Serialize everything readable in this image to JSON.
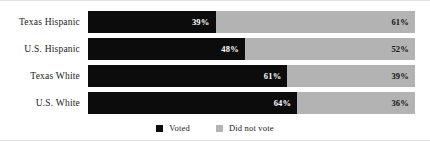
{
  "chart_data": {
    "type": "bar",
    "title": "",
    "subtitle": "",
    "xlabel": "",
    "ylabel": "",
    "orientation": "horizontal",
    "stacked": true,
    "normalized_percent": true,
    "grid": false,
    "xlim": [
      0,
      100
    ],
    "legend_position": "bottom-center",
    "categories": [
      "Texas Hispanic",
      "U.S. Hispanic",
      "Texas White",
      "U.S. White"
    ],
    "series": [
      {
        "name": "Voted",
        "color": "#0c0c0c",
        "values": [
          39,
          48,
          61,
          64
        ],
        "value_labels": [
          "39%",
          "48%",
          "61%",
          "64%"
        ]
      },
      {
        "name": "Did not vote",
        "color": "#b3b3b3",
        "values": [
          61,
          52,
          39,
          36
        ],
        "value_labels": [
          "61%",
          "52%",
          "39%",
          "36%"
        ]
      }
    ]
  },
  "rows": [
    {
      "label": "Texas Hispanic",
      "voted_pct": 39,
      "voted_label": "39%",
      "notvoted_pct": 61,
      "notvoted_label": "61%"
    },
    {
      "label": "U.S. Hispanic",
      "voted_pct": 48,
      "voted_label": "48%",
      "notvoted_pct": 52,
      "notvoted_label": "52%"
    },
    {
      "label": "Texas White",
      "voted_pct": 61,
      "voted_label": "61%",
      "notvoted_pct": 39,
      "notvoted_label": "39%"
    },
    {
      "label": "U.S. White",
      "voted_pct": 64,
      "voted_label": "64%",
      "notvoted_pct": 36,
      "notvoted_label": "36%"
    }
  ],
  "legend": {
    "items": [
      {
        "label": "Voted",
        "color": "#0c0c0c"
      },
      {
        "label": "Did not vote",
        "color": "#b3b3b3"
      }
    ]
  },
  "colors": {
    "voted": "#0c0c0c",
    "not_voted": "#b3b3b3",
    "background": "#ffffff",
    "text": "#1a1a1a"
  }
}
